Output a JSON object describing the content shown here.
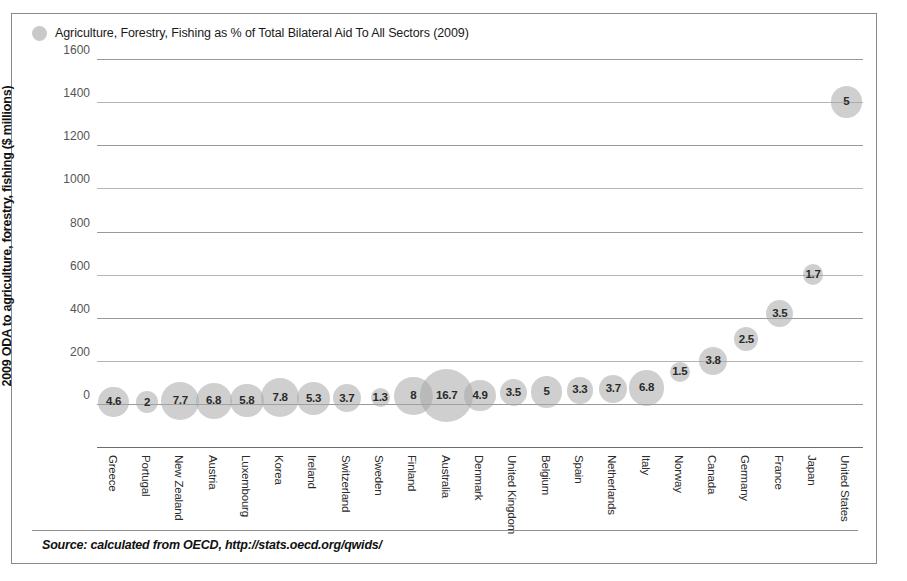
{
  "legend": {
    "label": "Agriculture, Forestry, Fishing as % of Total Bilateral Aid To All Sectors (2009)",
    "marker_color": "#c9c9c9"
  },
  "axis": {
    "y_title": "2009 ODA to agriculture, forestry, fishing ($ millions)"
  },
  "source": {
    "text": "Source: calculated from OECD, http://stats.oecd.org/qwids/"
  },
  "chart_data": {
    "type": "bubble",
    "title": "Agriculture, Forestry, Fishing as % of Total Bilateral Aid To All Sectors (2009)",
    "xlabel": "",
    "ylabel": "2009 ODA to agriculture, forestry, fishing ($ millions)",
    "ylim": [
      0,
      1600
    ],
    "yticks": [
      0,
      200,
      400,
      600,
      800,
      1000,
      1200,
      1400,
      1600
    ],
    "grid": true,
    "legend_position": "top-left",
    "bubble_value_units": "percent of total bilateral aid",
    "categories": [
      "Greece",
      "Portugal",
      "New Zealand",
      "Austria",
      "Luxembourg",
      "Korea",
      "Ireland",
      "Switzerland",
      "Sweden",
      "Finland",
      "Australia",
      "Denmark",
      "United Kingdom",
      "Belgium",
      "Spain",
      "Netherlands",
      "Italy",
      "Norway",
      "Canada",
      "Germany",
      "France",
      "Japan",
      "United States"
    ],
    "points": [
      {
        "category": "Greece",
        "y": 10,
        "size": 4.6,
        "label": "4.6"
      },
      {
        "category": "Portugal",
        "y": 8,
        "size": 2,
        "label": "2"
      },
      {
        "category": "New Zealand",
        "y": 14,
        "size": 7.7,
        "label": "7.7"
      },
      {
        "category": "Austria",
        "y": 14,
        "size": 6.8,
        "label": "6.8"
      },
      {
        "category": "Luxembourg",
        "y": 16,
        "size": 5.8,
        "label": "5.8"
      },
      {
        "category": "Korea",
        "y": 30,
        "size": 7.8,
        "label": "7.8"
      },
      {
        "category": "Ireland",
        "y": 26,
        "size": 5.3,
        "label": "5.3"
      },
      {
        "category": "Switzerland",
        "y": 26,
        "size": 3.7,
        "label": "3.7"
      },
      {
        "category": "Sweden",
        "y": 30,
        "size": 1.3,
        "label": "1.3"
      },
      {
        "category": "Finland",
        "y": 36,
        "size": 8,
        "label": "8"
      },
      {
        "category": "Australia",
        "y": 38,
        "size": 16.7,
        "label": "16.7"
      },
      {
        "category": "Denmark",
        "y": 40,
        "size": 4.9,
        "label": "4.9"
      },
      {
        "category": "United Kingdom",
        "y": 52,
        "size": 3.5,
        "label": "3.5"
      },
      {
        "category": "Belgium",
        "y": 56,
        "size": 5,
        "label": "5"
      },
      {
        "category": "Spain",
        "y": 64,
        "size": 3.3,
        "label": "3.3"
      },
      {
        "category": "Netherlands",
        "y": 70,
        "size": 3.7,
        "label": "3.7"
      },
      {
        "category": "Italy",
        "y": 76,
        "size": 6.8,
        "label": "6.8"
      },
      {
        "category": "Norway",
        "y": 150,
        "size": 1.5,
        "label": "1.5"
      },
      {
        "category": "Canada",
        "y": 200,
        "size": 3.8,
        "label": "3.8"
      },
      {
        "category": "Germany",
        "y": 300,
        "size": 2.5,
        "label": "2.5"
      },
      {
        "category": "France",
        "y": 420,
        "size": 3.5,
        "label": "3.5"
      },
      {
        "category": "Japan",
        "y": 600,
        "size": 1.7,
        "label": "1.7"
      },
      {
        "category": "United States",
        "y": 1400,
        "size": 5,
        "label": "5"
      }
    ]
  }
}
